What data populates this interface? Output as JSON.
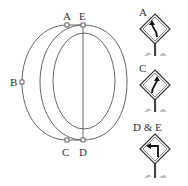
{
  "diagram": {
    "points": [
      {
        "id": "A",
        "label": "A",
        "x": 67,
        "y": 25,
        "lx": 64,
        "ly": 16
      },
      {
        "id": "E",
        "label": "E",
        "x": 83,
        "y": 25,
        "lx": 80,
        "ly": 16
      },
      {
        "id": "B",
        "label": "B",
        "x": 22,
        "y": 82,
        "lx": 10,
        "ly": 86
      },
      {
        "id": "C",
        "label": "C",
        "x": 67,
        "y": 140,
        "lx": 63,
        "ly": 156
      },
      {
        "id": "D",
        "label": "D",
        "x": 83,
        "y": 140,
        "lx": 79,
        "ly": 156
      }
    ],
    "signs": [
      {
        "caption": "A",
        "icon": "curve-left-sign-icon",
        "meaning": "Curve to the left"
      },
      {
        "caption": "C",
        "icon": "curve-right-sign-icon",
        "meaning": "Curve to the right"
      },
      {
        "caption": "D & E",
        "icon": "sharp-left-turn-sign-icon",
        "meaning": "Sharp left turn"
      }
    ]
  }
}
